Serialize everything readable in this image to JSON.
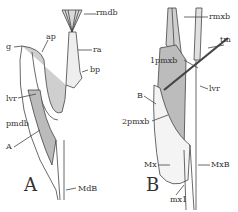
{
  "figure": {
    "panel_a": {
      "letter": "A",
      "labels": {
        "rmdb": "rmdb",
        "g": "g",
        "ap": "ap",
        "ra": "ra",
        "bp": "bp",
        "lvr": "lvr",
        "pmdb": "pmdb",
        "A": "A",
        "MdB": "MdB"
      }
    },
    "panel_b": {
      "letter": "B",
      "labels": {
        "rmxb": "rmxb",
        "tm": "tm",
        "1pmxb": "1pmxb",
        "lvr": "lvr",
        "B": "B",
        "2pmxb": "2pmxb",
        "Mx": "Mx",
        "MxB": "MxB",
        "mx1": "mx1"
      }
    }
  }
}
